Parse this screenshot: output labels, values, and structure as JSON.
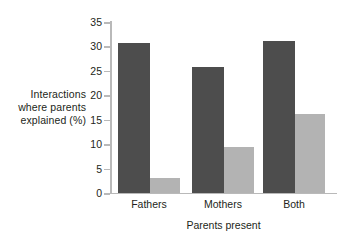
{
  "chart_data": {
    "type": "bar",
    "title": "",
    "subtitle": "",
    "xlabel": "Parents present",
    "ylabel": "Interactions where parents explained (%)",
    "ylabel_lines": [
      "Interactions",
      "where parents",
      "explained (%)"
    ],
    "categories": [
      "Fathers",
      "Mothers",
      "Both"
    ],
    "series": [
      {
        "name": "dark",
        "color": "#4d4d4d",
        "values": [
          30.8,
          25.8,
          31.1
        ]
      },
      {
        "name": "light",
        "color": "#b3b3b3",
        "values": [
          3.1,
          9.4,
          16.2
        ]
      }
    ],
    "ylim": [
      0,
      35
    ],
    "yticks": [
      0,
      5,
      10,
      15,
      20,
      25,
      30,
      35
    ],
    "ytick_labels": [
      "0",
      "5",
      "10",
      "15",
      "20",
      "25",
      "30",
      "35"
    ],
    "grid": false,
    "legend": "none",
    "legend_position": "none",
    "axis_color": "#b9b9b9",
    "text_color": "#231f20",
    "background": "#ffffff"
  }
}
